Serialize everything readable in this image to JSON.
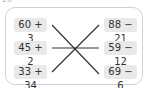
{
  "question_number": "10",
  "left_expressions": [
    "60 + 3",
    "45 + 2",
    "33 + 34"
  ],
  "right_expressions": [
    "88 − 21",
    "59 − 12",
    "69 − 6"
  ],
  "line_color": "#333333",
  "box_color": "#e9e9e9"
}
